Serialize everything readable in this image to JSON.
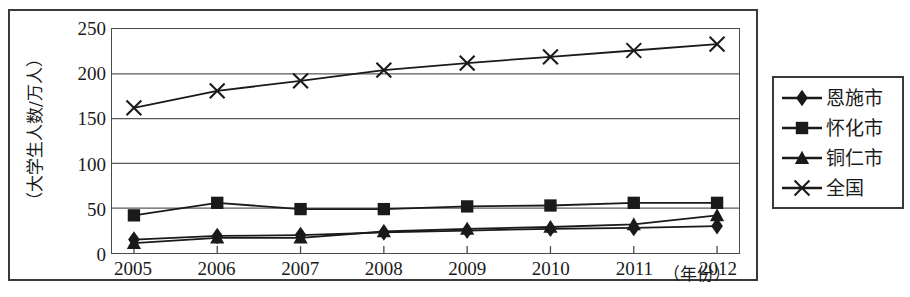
{
  "chart_data": {
    "type": "line",
    "title": "",
    "xlabel": "（年份）",
    "ylabel": "（大学生人数/万人）",
    "categories": [
      "2005",
      "2006",
      "2007",
      "2008",
      "2009",
      "2010",
      "2011",
      "2012"
    ],
    "xlim": [
      2005,
      2012
    ],
    "ylim": [
      0,
      250
    ],
    "yticks": [
      "0",
      "50",
      "100",
      "150",
      "200",
      "250"
    ],
    "ytick_values": [
      0,
      50,
      100,
      150,
      200,
      250
    ],
    "grid": true,
    "grid_axis": "y",
    "legend_position": "right-outside",
    "series": [
      {
        "name": "恩施市",
        "marker": "diamond",
        "color": "#1a1a1a",
        "values": [
          15,
          19,
          20,
          23,
          25,
          27,
          28,
          30
        ]
      },
      {
        "name": "怀化市",
        "marker": "square",
        "color": "#1a1a1a",
        "values": [
          42,
          56,
          49,
          49,
          52,
          53,
          56,
          56
        ]
      },
      {
        "name": "铜仁市",
        "marker": "triangle",
        "color": "#1a1a1a",
        "values": [
          11,
          17,
          17,
          24,
          27,
          29,
          32,
          42
        ]
      },
      {
        "name": "全国",
        "marker": "cross",
        "color": "#1a1a1a",
        "values": [
          162,
          181,
          192,
          204,
          212,
          219,
          226,
          233
        ]
      }
    ]
  },
  "figure": {
    "frame_color": "#3a3a3a",
    "plot_border_color": "#4a4a4a",
    "gridline_color": "#5a5a5a",
    "background": "#ffffff"
  }
}
